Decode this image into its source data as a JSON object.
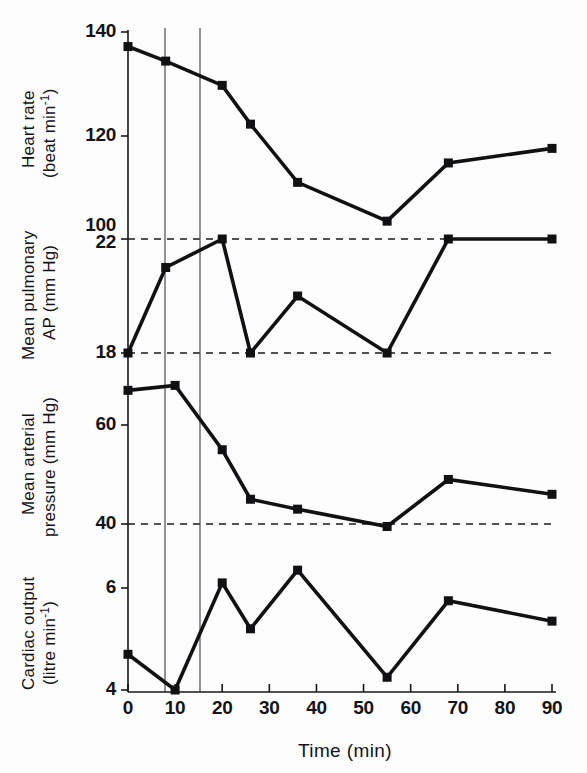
{
  "figure": {
    "xlabel": "Time (min)",
    "x_ticks": [
      "0",
      "10",
      "20",
      "30",
      "40",
      "50",
      "60",
      "70",
      "80",
      "90"
    ]
  },
  "panels": {
    "hr": {
      "title_line1": "Heart rate",
      "title_line2": "(beat min",
      "title_sup": "-1",
      "title_close": ")",
      "ticks": [
        "140",
        "120",
        "100"
      ]
    },
    "pap": {
      "title_line1": "Mean pulmonary",
      "title_line2": "AP (mm Hg)",
      "ticks": [
        "22",
        "18"
      ]
    },
    "map": {
      "title_line1": "Mean arterial",
      "title_line2": "pressure (mm Hg)",
      "ticks": [
        "60",
        "40"
      ]
    },
    "co": {
      "title_line1": "Cardiac output",
      "title_line2": "(litre min",
      "title_sup": "-1",
      "title_close": ")",
      "ticks": [
        "6",
        "4"
      ]
    }
  },
  "chart_data": {
    "type": "line",
    "title": "",
    "xlabel": "Time (min)",
    "xlim": [
      0,
      90
    ],
    "x_ticks": [
      0,
      10,
      20,
      30,
      40,
      50,
      60,
      70,
      80,
      90
    ],
    "grid": false,
    "legend": "none",
    "vertical_reference_lines": [
      12,
      20
    ],
    "panels": [
      {
        "name": "Heart rate",
        "ylabel": "Heart rate (beat min-1)",
        "yunit": "beat min^-1",
        "ylim": [
          100,
          140
        ],
        "y_ticks": [
          100,
          120,
          140
        ],
        "dashed_reference_lines": [],
        "x": [
          0,
          8,
          20,
          26,
          36,
          55,
          68,
          90
        ],
        "y": [
          137,
          134,
          129,
          121,
          109,
          101,
          113,
          116
        ]
      },
      {
        "name": "Mean pulmonary AP",
        "ylabel": "Mean pulmonary AP (mm Hg)",
        "yunit": "mmHg",
        "ylim": [
          17,
          23
        ],
        "y_ticks": [
          18,
          22
        ],
        "dashed_reference_lines": [
          18,
          22
        ],
        "x": [
          0,
          8,
          20,
          26,
          36,
          55,
          68,
          90
        ],
        "y": [
          18,
          21,
          22,
          18,
          20,
          18,
          22,
          22
        ]
      },
      {
        "name": "Mean arterial pressure",
        "ylabel": "Mean arterial pressure (mm Hg)",
        "yunit": "mmHg",
        "ylim": [
          38,
          72
        ],
        "y_ticks": [
          40,
          60
        ],
        "dashed_reference_lines": [
          40
        ],
        "x": [
          0,
          10,
          20,
          26,
          36,
          55,
          68,
          90
        ],
        "y": [
          67,
          68,
          55,
          45,
          43,
          39.5,
          49,
          46
        ]
      },
      {
        "name": "Cardiac output",
        "ylabel": "Cardiac output (litre min-1)",
        "yunit": "litre min^-1",
        "ylim": [
          4,
          6.6
        ],
        "y_ticks": [
          4,
          6
        ],
        "dashed_reference_lines": [],
        "x": [
          0,
          10,
          20,
          26,
          36,
          55,
          68,
          90
        ],
        "y": [
          4.7,
          4.0,
          6.1,
          5.2,
          6.35,
          4.25,
          5.75,
          5.35
        ]
      }
    ]
  }
}
